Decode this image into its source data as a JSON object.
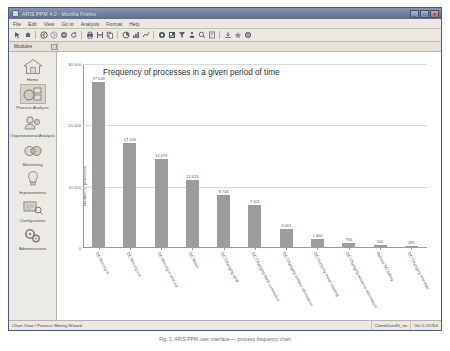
{
  "window": {
    "title": "ARIS PPM 4.0 - Mozilla Firefox",
    "icon": "firefox-icon",
    "buttons": {
      "minimize": "_",
      "maximize": "□",
      "close": "×"
    }
  },
  "menu": {
    "items": [
      "File",
      "Edit",
      "View",
      "Go to",
      "Analysis",
      "Format",
      "Help"
    ]
  },
  "toolbar": {
    "groups": [
      [
        "cursor-icon",
        "pan-icon"
      ],
      [
        "back-icon",
        "forward-icon",
        "stop-icon",
        "refresh-icon"
      ],
      [
        "print-icon",
        "save-icon",
        "copy-icon"
      ],
      [
        "chart-icon",
        "pie-icon",
        "bar-icon"
      ],
      [
        "table-icon",
        "grid-icon",
        "filter-icon",
        "sort-icon",
        "zoom-icon",
        "list-icon"
      ],
      [
        "export-icon",
        "favorite-icon",
        "settings-icon"
      ]
    ]
  },
  "panel": {
    "label": "Modules",
    "pin": "pin-icon"
  },
  "sidebar": {
    "items": [
      {
        "label": "Home",
        "icon": "house-icon",
        "selected": false
      },
      {
        "label": "Process Analysis",
        "icon": "process-analysis-icon",
        "selected": true
      },
      {
        "label": "Organizational Analysis",
        "icon": "organizational-analysis-icon",
        "selected": false
      },
      {
        "label": "Monitoring",
        "icon": "monitoring-icon",
        "selected": false
      },
      {
        "label": "Improvements",
        "icon": "lightbulb-icon",
        "selected": false
      },
      {
        "label": "Configuration",
        "icon": "configuration-icon",
        "selected": false
      },
      {
        "label": "Administration",
        "icon": "administration-icon",
        "selected": false
      }
    ]
  },
  "statusbar": {
    "left": "Chart View / Process Mining Wizard",
    "user": "ClientUser45_en",
    "version": "Ver 0.15764"
  },
  "caption": "Fig. 3.  ARIS PPM user interface — process frequency chart",
  "chart_data": {
    "type": "bar",
    "title": "Frequency of processes in a given period of time",
    "xlabel": "",
    "ylabel": "Number of processes",
    "ylim": [
      0,
      30000
    ],
    "yticks": [
      0,
      10000,
      20000,
      30000
    ],
    "ytick_labels": [
      "0",
      "10 000",
      "20 000",
      "30 000"
    ],
    "grid": true,
    "legend": "none",
    "bar_color": "#9c9c9c",
    "categories": [
      "OC Moving in",
      "OC Moving out",
      "OC Moving in and out",
      "OC Meter",
      "OC Changing tariff",
      "OC Changing bank connection",
      "OC Changing contact information",
      "OC Notifying meter reading",
      "OC Changing advance information",
      "Refund OC billing",
      "OC Changing end date"
    ],
    "values": [
      27018,
      17100,
      14473,
      11073,
      8706,
      7011,
      3091,
      1400,
      750,
      500,
      281
    ],
    "value_labels": [
      "27 018",
      "17 100",
      "14 473",
      "11 073",
      "8 706",
      "7 011",
      "3 091",
      "1 400",
      "750",
      "500",
      "281"
    ]
  }
}
